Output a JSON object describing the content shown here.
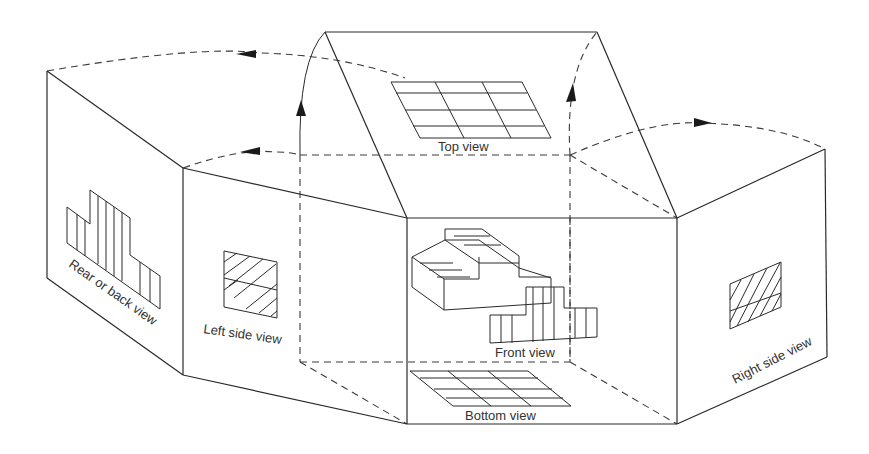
{
  "diagram": {
    "colors": {
      "line": "#2a2a2a",
      "text": "#333333",
      "background": "#ffffff"
    },
    "labels": {
      "top": "Top view",
      "front": "Front view",
      "bottom": "Bottom view",
      "left": "Left side view",
      "right": "Right side view",
      "rear": "Rear or back view"
    },
    "panels": [
      {
        "id": "top",
        "label": "Top view",
        "content": "3x4 grid (top view of object)"
      },
      {
        "id": "front",
        "label": "Front view",
        "content": "isometric stepped object with stepped front profile"
      },
      {
        "id": "bottom",
        "label": "Bottom view",
        "content": "3x4 grid (bottom view of object)"
      },
      {
        "id": "left",
        "label": "Left side view",
        "content": "hatched rectangle"
      },
      {
        "id": "right",
        "label": "Right side view",
        "content": "hatched rectangle"
      },
      {
        "id": "rear",
        "label": "Rear or back view",
        "content": "stepped profile with vertical hatching"
      }
    ],
    "fold_arrows": [
      {
        "from": "left side panel",
        "to": "rear panel",
        "direction": "left"
      },
      {
        "from": "top of box",
        "to": "rear panel",
        "direction": "left"
      },
      {
        "from": "front-left edge",
        "to": "top panel",
        "direction": "up"
      },
      {
        "from": "front-right edge",
        "to": "top panel",
        "direction": "up"
      },
      {
        "from": "right side fold",
        "to": "right side panel",
        "direction": "right"
      }
    ]
  }
}
